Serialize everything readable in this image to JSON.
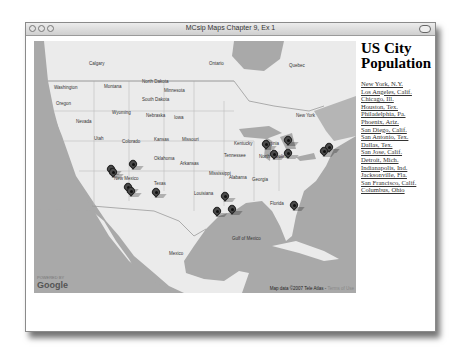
{
  "window": {
    "title": "MCsip Maps Chapter 9, Ex 1"
  },
  "sidebar": {
    "heading": "US City Population",
    "cities": [
      {
        "label": "New York, N.Y."
      },
      {
        "label": "Los Angeles, Calif."
      },
      {
        "label": "Chicago, Ill."
      },
      {
        "label": "Houston, Tex."
      },
      {
        "label": "Philadelphia, Pa."
      },
      {
        "label": "Phoenix, Ariz."
      },
      {
        "label": "San Diego, Calif."
      },
      {
        "label": "San Antonio, Tex."
      },
      {
        "label": "Dallas, Tex."
      },
      {
        "label": "San Jose, Calif."
      },
      {
        "label": "Detroit, Mich."
      },
      {
        "label": "Indianapolis, Ind."
      },
      {
        "label": "Jacksonville, Fla."
      },
      {
        "label": "San Francisco, Calif."
      },
      {
        "label": "Columbus, Ohio"
      }
    ]
  },
  "map": {
    "logo": "Google",
    "powered_by": "POWERED BY",
    "attribution": "Map data ©2007 Tele Atlas -",
    "terms": "Terms of Use",
    "labels": [
      {
        "text": "Washington",
        "x": 20,
        "y": 44
      },
      {
        "text": "Oregon",
        "x": 22,
        "y": 60
      },
      {
        "text": "Montana",
        "x": 70,
        "y": 43
      },
      {
        "text": "Wyoming",
        "x": 78,
        "y": 69
      },
      {
        "text": "North Dakota",
        "x": 108,
        "y": 38
      },
      {
        "text": "South Dakota",
        "x": 108,
        "y": 56
      },
      {
        "text": "Nebraska",
        "x": 112,
        "y": 72
      },
      {
        "text": "Minnesota",
        "x": 130,
        "y": 47
      },
      {
        "text": "Iowa",
        "x": 140,
        "y": 74
      },
      {
        "text": "Utah",
        "x": 60,
        "y": 95
      },
      {
        "text": "Colorado",
        "x": 88,
        "y": 98
      },
      {
        "text": "Kansas",
        "x": 120,
        "y": 96
      },
      {
        "text": "Missouri",
        "x": 148,
        "y": 96
      },
      {
        "text": "New Mexico",
        "x": 80,
        "y": 135
      },
      {
        "text": "Oklahoma",
        "x": 120,
        "y": 115
      },
      {
        "text": "Arkansas",
        "x": 146,
        "y": 120
      },
      {
        "text": "Texas",
        "x": 120,
        "y": 140
      },
      {
        "text": "Louisiana",
        "x": 160,
        "y": 150
      },
      {
        "text": "Mississippi",
        "x": 175,
        "y": 130
      },
      {
        "text": "Alabama",
        "x": 195,
        "y": 134
      },
      {
        "text": "Tennessee",
        "x": 190,
        "y": 112
      },
      {
        "text": "Kentucky",
        "x": 200,
        "y": 100
      },
      {
        "text": "Virginia",
        "x": 230,
        "y": 100
      },
      {
        "text": "North Carolina",
        "x": 225,
        "y": 113
      },
      {
        "text": "Georgia",
        "x": 218,
        "y": 136
      },
      {
        "text": "Florida",
        "x": 236,
        "y": 160
      },
      {
        "text": "Ontario",
        "x": 175,
        "y": 20
      },
      {
        "text": "Quebec",
        "x": 255,
        "y": 22
      },
      {
        "text": "Mexico",
        "x": 135,
        "y": 210
      },
      {
        "text": "Gulf of Mexico",
        "x": 198,
        "y": 195
      },
      {
        "text": "New York",
        "x": 262,
        "y": 72
      },
      {
        "text": "Calgary",
        "x": 55,
        "y": 20
      },
      {
        "text": "Nevada",
        "x": 42,
        "y": 78
      }
    ],
    "markers": [
      {
        "city": "San Francisco",
        "x": 77,
        "y": 135
      },
      {
        "city": "San Jose",
        "x": 79,
        "y": 138
      },
      {
        "city": "Reno area",
        "x": 99,
        "y": 130
      },
      {
        "city": "Los Angeles",
        "x": 94,
        "y": 153
      },
      {
        "city": "San Diego",
        "x": 97,
        "y": 157
      },
      {
        "city": "Phoenix",
        "x": 122,
        "y": 158
      },
      {
        "city": "Chicago",
        "x": 232,
        "y": 110
      },
      {
        "city": "Detroit",
        "x": 254,
        "y": 106
      },
      {
        "city": "Indianapolis",
        "x": 240,
        "y": 120
      },
      {
        "city": "Columbus",
        "x": 254,
        "y": 119
      },
      {
        "city": "New York",
        "x": 295,
        "y": 113
      },
      {
        "city": "Philadelphia",
        "x": 290,
        "y": 117
      },
      {
        "city": "Dallas",
        "x": 191,
        "y": 162
      },
      {
        "city": "San Antonio",
        "x": 183,
        "y": 177
      },
      {
        "city": "Houston",
        "x": 198,
        "y": 175
      },
      {
        "city": "Jacksonville",
        "x": 260,
        "y": 171
      }
    ]
  }
}
